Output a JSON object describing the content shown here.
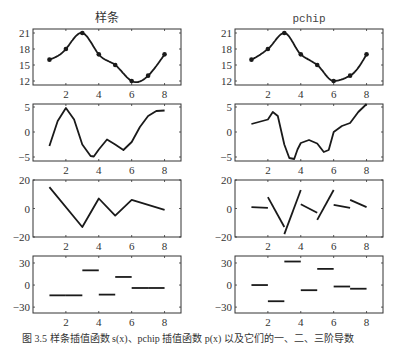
{
  "figure": {
    "caption": "图 3.5   样条插值函数 s(x)、pchip 插值函数 p(x) 以及它们的一、二、三阶导数",
    "colors": {
      "line": "#1a1a1a",
      "axis": "#333333",
      "background": "#ffffff"
    }
  },
  "chart_data": [
    {
      "type": "line",
      "title": "样条",
      "panel": "row1-left",
      "markers": {
        "x": [
          1,
          2,
          3,
          4,
          5,
          6,
          7,
          8
        ],
        "y": [
          16,
          18,
          21,
          17,
          15,
          12,
          13,
          17
        ]
      },
      "curve": "spline-interpolant",
      "xlim": [
        0,
        9
      ],
      "ylim": [
        11.25,
        21.75
      ],
      "xticks": [
        2,
        4,
        6,
        8
      ],
      "yticks": [
        12,
        15,
        18,
        21
      ]
    },
    {
      "type": "line",
      "title": "pchip",
      "panel": "row1-right",
      "markers": {
        "x": [
          1,
          2,
          3,
          4,
          5,
          6,
          7,
          8
        ],
        "y": [
          16,
          18,
          21,
          17,
          15,
          12,
          13,
          17
        ]
      },
      "curve": "pchip-interpolant",
      "xlim": [
        0,
        9
      ],
      "ylim": [
        11.25,
        21.75
      ],
      "xticks": [
        2,
        4,
        6,
        8
      ],
      "yticks": [
        12,
        15,
        18,
        21
      ]
    },
    {
      "type": "line",
      "title": "",
      "panel": "row2-left",
      "curve": "spline-first-derivative",
      "x": [
        1,
        1.5,
        2,
        2.5,
        3,
        3.5,
        3.7,
        4,
        4.5,
        5,
        5.5,
        6,
        6.5,
        7,
        7.5,
        8
      ],
      "y": [
        -2.8,
        2.2,
        4.8,
        2.5,
        -2.5,
        -4.8,
        -4.9,
        -3.5,
        -1.5,
        -2.5,
        -3.6,
        -2.0,
        1.0,
        3.2,
        4.2,
        4.3
      ],
      "xlim": [
        0,
        9
      ],
      "ylim": [
        -5.8,
        5.6
      ],
      "xticks": [
        2,
        4,
        6,
        8
      ],
      "yticks": [
        -5,
        0,
        5
      ]
    },
    {
      "type": "line",
      "title": "",
      "panel": "row2-right",
      "curve": "pchip-first-derivative",
      "x": [
        1,
        2,
        2.3,
        2.6,
        3,
        3.3,
        3.6,
        3.8,
        4,
        4.5,
        5,
        5.4,
        5.7,
        6,
        6.5,
        7,
        7.5,
        8
      ],
      "y": [
        1.6,
        2.5,
        4.0,
        3.2,
        -2.5,
        -5.2,
        -5.4,
        -3.5,
        -2.2,
        -1.6,
        -2.3,
        -4.0,
        -3.6,
        0.0,
        1.2,
        1.8,
        4.0,
        5.6
      ],
      "xlim": [
        0,
        9
      ],
      "ylim": [
        -5.8,
        5.6
      ],
      "xticks": [
        2,
        4,
        6,
        8
      ],
      "yticks": [
        -5,
        0,
        5
      ]
    },
    {
      "type": "line",
      "title": "",
      "panel": "row3-left",
      "curve": "spline-second-derivative",
      "x": [
        1,
        3,
        4,
        5,
        6,
        8
      ],
      "y": [
        15,
        -13,
        7,
        -5,
        6,
        -1
      ],
      "xlim": [
        0,
        9
      ],
      "ylim": [
        -20,
        20
      ],
      "xticks": [
        2,
        4,
        6,
        8
      ],
      "yticks": [
        -20,
        0,
        20
      ]
    },
    {
      "type": "segments",
      "title": "",
      "panel": "row3-right",
      "curve": "pchip-second-derivative",
      "segments": [
        [
          [
            1,
            1
          ],
          [
            2,
            0.5
          ]
        ],
        [
          [
            2,
            8
          ],
          [
            3,
            -13
          ]
        ],
        [
          [
            3,
            -18
          ],
          [
            4,
            13
          ]
        ],
        [
          [
            4,
            3
          ],
          [
            5,
            -3
          ]
        ],
        [
          [
            5,
            -8
          ],
          [
            6,
            13
          ]
        ],
        [
          [
            6,
            2.5
          ],
          [
            7,
            0.5
          ]
        ],
        [
          [
            7,
            6
          ],
          [
            8,
            1
          ]
        ]
      ],
      "xlim": [
        0,
        9
      ],
      "ylim": [
        -20,
        20
      ],
      "xticks": [
        2,
        4,
        6,
        8
      ],
      "yticks": [
        -20,
        0,
        20
      ]
    },
    {
      "type": "segments",
      "title": "",
      "panel": "row4-left",
      "curve": "spline-third-derivative",
      "segments": [
        [
          [
            1,
            -14
          ],
          [
            2,
            -14
          ]
        ],
        [
          [
            2,
            -14
          ],
          [
            3,
            -14
          ]
        ],
        [
          [
            3,
            20
          ],
          [
            4,
            20
          ]
        ],
        [
          [
            4,
            -13
          ],
          [
            5,
            -13
          ]
        ],
        [
          [
            5,
            11
          ],
          [
            6,
            11
          ]
        ],
        [
          [
            6,
            -4
          ],
          [
            7,
            -4
          ]
        ],
        [
          [
            7,
            -4
          ],
          [
            8,
            -4
          ]
        ]
      ],
      "xlim": [
        0,
        9
      ],
      "ylim": [
        -38,
        39.5
      ],
      "xticks": [
        2,
        4,
        6,
        8
      ],
      "yticks": [
        -30,
        0,
        30
      ]
    },
    {
      "type": "segments",
      "title": "",
      "panel": "row4-right",
      "curve": "pchip-third-derivative",
      "segments": [
        [
          [
            1,
            0
          ],
          [
            2,
            0
          ]
        ],
        [
          [
            2,
            -22
          ],
          [
            3,
            -22
          ]
        ],
        [
          [
            3,
            32
          ],
          [
            4,
            32
          ]
        ],
        [
          [
            4,
            -7
          ],
          [
            5,
            -7
          ]
        ],
        [
          [
            5,
            22
          ],
          [
            6,
            22
          ]
        ],
        [
          [
            6,
            -2
          ],
          [
            7,
            -2
          ]
        ],
        [
          [
            7,
            -5
          ],
          [
            8,
            -5
          ]
        ]
      ],
      "xlim": [
        0,
        9
      ],
      "ylim": [
        -38,
        39.5
      ],
      "xticks": [
        2,
        4,
        6,
        8
      ],
      "yticks": [
        -30,
        0,
        30
      ]
    }
  ]
}
